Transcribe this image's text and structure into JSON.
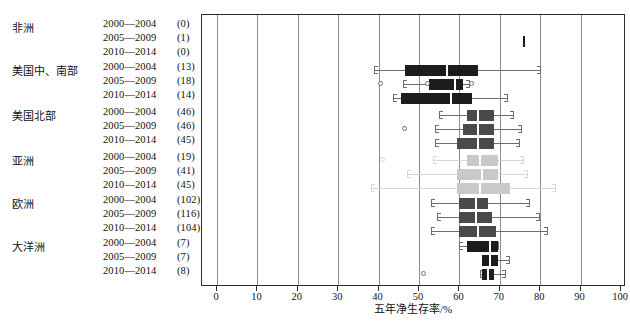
{
  "axis": {
    "title": "五年净生存率/%",
    "ticks": [
      0,
      10,
      20,
      30,
      40,
      50,
      60,
      70,
      80,
      90,
      100
    ],
    "min": 0,
    "max": 100
  },
  "colors": {
    "dark": "#1c1c1c",
    "mid": "#4a4a4a",
    "light": "#c9c9c9",
    "grid": "#8d8d8d",
    "frame": "#2b2b2b"
  },
  "caption": "",
  "groups": [
    {
      "name": "非洲",
      "shade": "dark",
      "periods": [
        {
          "years": "2000—2004",
          "count": "(0)"
        },
        {
          "years": "2005—2009",
          "count": "(1)"
        },
        {
          "years": "2010—2014",
          "count": "(0)"
        }
      ]
    },
    {
      "name": "美国中、南部",
      "shade": "dark",
      "periods": [
        {
          "years": "2000—2004",
          "count": "(13)"
        },
        {
          "years": "2005—2009",
          "count": "(18)"
        },
        {
          "years": "2010—2014",
          "count": "(14)"
        }
      ]
    },
    {
      "name": "美国北部",
      "shade": "mid",
      "periods": [
        {
          "years": "2000—2004",
          "count": "(46)"
        },
        {
          "years": "2005—2009",
          "count": "(46)"
        },
        {
          "years": "2010—2014",
          "count": "(45)"
        }
      ]
    },
    {
      "name": "亚洲",
      "shade": "light",
      "periods": [
        {
          "years": "2000—2004",
          "count": "(19)"
        },
        {
          "years": "2005—2009",
          "count": "(41)"
        },
        {
          "years": "2010—2014",
          "count": "(45)"
        }
      ]
    },
    {
      "name": "欧洲",
      "shade": "mid",
      "periods": [
        {
          "years": "2000—2004",
          "count": "(102)"
        },
        {
          "years": "2005—2009",
          "count": "(116)"
        },
        {
          "years": "2010—2014",
          "count": "(104)"
        }
      ]
    },
    {
      "name": "大洋洲",
      "shade": "dark",
      "periods": [
        {
          "years": "2000—2004",
          "count": "(7)"
        },
        {
          "years": "2005—2009",
          "count": "(7)"
        },
        {
          "years": "2010—2014",
          "count": "(8)"
        }
      ]
    }
  ],
  "chart_data": {
    "type": "box",
    "title": "",
    "xlabel": "五年净生存率/%",
    "ylabel": "",
    "xlim": [
      0,
      100
    ],
    "grid": true,
    "orientation": "horizontal",
    "legend": "none",
    "note": "Box plot of 5-year net survival by region and period; number in parentheses = number of registries",
    "boxes": [
      {
        "group": "非洲",
        "period": "2000—2004",
        "n": 0,
        "shade": "dark",
        "whisker_low": null,
        "q1": null,
        "median": null,
        "q3": null,
        "whisker_high": null,
        "outliers": []
      },
      {
        "group": "非洲",
        "period": "2005—2009",
        "n": 1,
        "shade": "dark",
        "whisker_low": 75.5,
        "q1": 75.5,
        "median": 75.5,
        "q3": 76.3,
        "whisker_high": 76.3,
        "outliers": []
      },
      {
        "group": "非洲",
        "period": "2010—2014",
        "n": 0,
        "shade": "dark",
        "whisker_low": null,
        "q1": null,
        "median": null,
        "q3": null,
        "whisker_high": null,
        "outliers": []
      },
      {
        "group": "美国中、南部",
        "period": "2000—2004",
        "n": 13,
        "shade": "dark",
        "whisker_low": 38.8,
        "q1": 46.5,
        "median": 57.0,
        "q3": 64.5,
        "whisker_high": 80.3,
        "outliers": []
      },
      {
        "group": "美国中、南部",
        "period": "2005—2009",
        "n": 18,
        "shade": "dark",
        "whisker_low": 46.0,
        "q1": 52.5,
        "median": 59.0,
        "q3": 61.0,
        "whisker_high": 62.5,
        "outliers": [
          40.5,
          52.0,
          63.0
        ]
      },
      {
        "group": "美国中、南部",
        "period": "2010—2014",
        "n": 14,
        "shade": "dark",
        "whisker_low": 43.5,
        "q1": 45.5,
        "median": 58.0,
        "q3": 63.0,
        "whisker_high": 72.0,
        "outliers": []
      },
      {
        "group": "美国北部",
        "period": "2000—2004",
        "n": 46,
        "shade": "mid",
        "whisker_low": 55.0,
        "q1": 62.0,
        "median": 64.5,
        "q3": 68.5,
        "whisker_high": 73.5,
        "outliers": []
      },
      {
        "group": "美国北部",
        "period": "2005—2009",
        "n": 46,
        "shade": "mid",
        "whisker_low": 54.0,
        "q1": 61.0,
        "median": 64.5,
        "q3": 68.5,
        "whisker_high": 75.5,
        "outliers": [
          46.5
        ]
      },
      {
        "group": "美国北部",
        "period": "2010—2014",
        "n": 45,
        "shade": "mid",
        "whisker_low": 54.0,
        "q1": 59.5,
        "median": 64.5,
        "q3": 68.5,
        "whisker_high": 75.0,
        "outliers": []
      },
      {
        "group": "亚洲",
        "period": "2000—2004",
        "n": 19,
        "shade": "light",
        "whisker_low": 53.5,
        "q1": 62.0,
        "median": 65.0,
        "q3": 69.5,
        "whisker_high": 76.0,
        "outliers": [
          41.0
        ]
      },
      {
        "group": "亚洲",
        "period": "2005—2009",
        "n": 41,
        "shade": "light",
        "whisker_low": 47.0,
        "q1": 59.5,
        "median": 65.5,
        "q3": 69.5,
        "whisker_high": 77.0,
        "outliers": []
      },
      {
        "group": "亚洲",
        "period": "2010—2014",
        "n": 45,
        "shade": "light",
        "whisker_low": 38.0,
        "q1": 59.5,
        "median": 65.0,
        "q3": 72.5,
        "whisker_high": 84.0,
        "outliers": []
      },
      {
        "group": "欧洲",
        "period": "2000—2004",
        "n": 102,
        "shade": "mid",
        "whisker_low": 53.0,
        "q1": 60.0,
        "median": 64.0,
        "q3": 67.0,
        "whisker_high": 77.5,
        "outliers": []
      },
      {
        "group": "欧洲",
        "period": "2005—2009",
        "n": 116,
        "shade": "mid",
        "whisker_low": 54.5,
        "q1": 60.0,
        "median": 64.0,
        "q3": 68.0,
        "whisker_high": 80.0,
        "outliers": []
      },
      {
        "group": "欧洲",
        "period": "2010—2014",
        "n": 104,
        "shade": "mid",
        "whisker_low": 53.0,
        "q1": 60.0,
        "median": 64.5,
        "q3": 69.0,
        "whisker_high": 82.0,
        "outliers": []
      },
      {
        "group": "大洋洲",
        "period": "2000—2004",
        "n": 7,
        "shade": "dark",
        "whisker_low": 60.0,
        "q1": 62.0,
        "median": 67.5,
        "q3": 69.5,
        "whisker_high": 69.8,
        "outliers": []
      },
      {
        "group": "大洋洲",
        "period": "2005—2009",
        "n": 7,
        "shade": "dark",
        "whisker_low": 65.5,
        "q1": 65.5,
        "median": 67.5,
        "q3": 69.5,
        "whisker_high": 72.5,
        "outliers": []
      },
      {
        "group": "大洋洲",
        "period": "2010—2014",
        "n": 8,
        "shade": "dark",
        "whisker_low": 65.0,
        "q1": 65.5,
        "median": 67.0,
        "q3": 68.5,
        "whisker_high": 71.5,
        "outliers": [
          51.0
        ]
      }
    ]
  }
}
